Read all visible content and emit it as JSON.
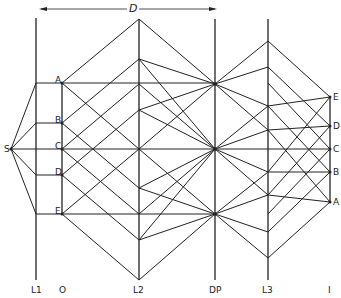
{
  "dimension": {
    "label": "D",
    "x1": 41,
    "x2": 215,
    "y": 9
  },
  "axes": [
    {
      "id": "L1",
      "label": "L1",
      "x": 36,
      "y1": 18,
      "y2": 280
    },
    {
      "id": "O",
      "label": "O",
      "x": 62,
      "y1": 83,
      "y2": 214,
      "short": true
    },
    {
      "id": "L2",
      "label": "L2",
      "x": 139,
      "y1": 19,
      "y2": 280
    },
    {
      "id": "DP",
      "label": "DP",
      "x": 215,
      "y1": 19,
      "y2": 280
    },
    {
      "id": "L3",
      "label": "L3",
      "x": 268,
      "y1": 19,
      "y2": 280
    },
    {
      "id": "I",
      "label": "I",
      "x": 330,
      "y1": 97,
      "y2": 202,
      "short": true
    }
  ],
  "source": {
    "label": "S",
    "x": 11,
    "y": 149
  },
  "object_points": [
    {
      "label": "A",
      "x": 62,
      "y": 83
    },
    {
      "label": "B",
      "x": 62,
      "y": 123
    },
    {
      "label": "C",
      "x": 62,
      "y": 149
    },
    {
      "label": "D",
      "x": 62,
      "y": 175
    },
    {
      "label": "E",
      "x": 62,
      "y": 214
    }
  ],
  "image_points": [
    {
      "label": "E",
      "x": 330,
      "y": 97
    },
    {
      "label": "D",
      "x": 330,
      "y": 126
    },
    {
      "label": "C",
      "x": 330,
      "y": 149
    },
    {
      "label": "B",
      "x": 330,
      "y": 172
    },
    {
      "label": "A",
      "x": 330,
      "y": 202
    }
  ],
  "bottom_labels": [
    {
      "text": "L1",
      "x": 31
    },
    {
      "text": "O",
      "x": 59
    },
    {
      "text": "L2",
      "x": 133
    },
    {
      "text": "DP",
      "x": 209
    },
    {
      "text": "L3",
      "x": 262
    },
    {
      "text": "I",
      "x": 328
    }
  ]
}
